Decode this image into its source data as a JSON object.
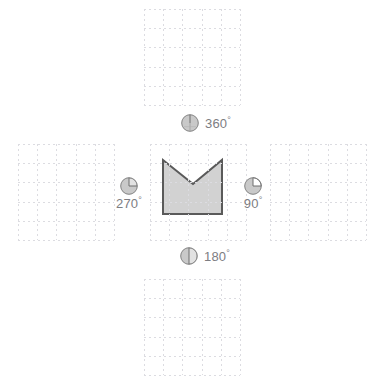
{
  "canvas": {
    "width": 379,
    "height": 386,
    "background": "#ffffff"
  },
  "style": {
    "grid_line_color": "#dcdce1",
    "shape_fill": "#d2d2d2",
    "shape_stroke": "#5a5a5a",
    "pie_fill": "#c9c9c9",
    "pie_light": "#e2e2e2",
    "pie_stroke": "#8c8c8c",
    "label_color": "#7d7d82"
  },
  "layout": {
    "arrangement": "plus-cross",
    "panel_count": 5,
    "grid_cells_per_side": 5,
    "panel_size_px": 96,
    "cell_size_px": 19.2
  },
  "panels": [
    {
      "id": "top",
      "name": "panel-top",
      "x": 144,
      "y": 9,
      "size": 96,
      "empty": true
    },
    {
      "id": "left",
      "name": "panel-left",
      "x": 18,
      "y": 144,
      "size": 96,
      "empty": true
    },
    {
      "id": "center",
      "name": "panel-center",
      "x": 150,
      "y": 144,
      "size": 96,
      "empty": false
    },
    {
      "id": "right",
      "name": "panel-right",
      "x": 270,
      "y": 144,
      "size": 96,
      "empty": true
    },
    {
      "id": "bottom",
      "name": "panel-bottom",
      "x": 144,
      "y": 279,
      "size": 96,
      "empty": true
    }
  ],
  "shape": {
    "name": "v-notched-pentagon",
    "description": "Square with a V notch cut into the top edge",
    "points": "163,160 163,214 222,214 222,160 193,184",
    "fill": "#d2d2d2",
    "stroke": "#5a5a5a",
    "stroke_width": 2
  },
  "markers": [
    {
      "id": "top",
      "name": "rotation-marker-360",
      "label": "360",
      "degree_symbol": "°",
      "angle": 360,
      "icon": "pie-360-icon",
      "x": 180,
      "y": 113,
      "orientation": "row"
    },
    {
      "id": "left",
      "name": "rotation-marker-270",
      "label": "270",
      "degree_symbol": "°",
      "angle": 270,
      "icon": "pie-270-icon",
      "x": 116,
      "y": 176,
      "orientation": "column"
    },
    {
      "id": "right",
      "name": "rotation-marker-90",
      "label": "90",
      "degree_symbol": "°",
      "angle": 90,
      "icon": "pie-90-icon",
      "x": 243,
      "y": 176,
      "orientation": "column"
    },
    {
      "id": "bottom",
      "name": "rotation-marker-180",
      "label": "180",
      "degree_symbol": "°",
      "angle": 180,
      "icon": "pie-180-icon",
      "x": 179,
      "y": 246,
      "orientation": "row"
    }
  ]
}
